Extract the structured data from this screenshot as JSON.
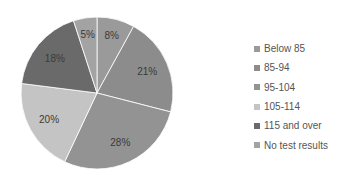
{
  "chart_data": {
    "type": "pie",
    "title": "",
    "categories": [
      "Below 85",
      "85-94",
      "95-104",
      "105-114",
      "115 and over",
      "No test results"
    ],
    "values": [
      8,
      21,
      28,
      20,
      18,
      5
    ],
    "labels": [
      "8%",
      "21%",
      "28%",
      "20%",
      "18%",
      "5%"
    ],
    "colors": [
      "#9a9a9a",
      "#8c8c8c",
      "#939393",
      "#c4c4c4",
      "#6a6a6a",
      "#a3a3a3"
    ],
    "start_angle": "12 o'clock",
    "direction": "clockwise",
    "legend_position": "right"
  },
  "legend": {
    "items": [
      {
        "label": "Below 85",
        "color": "#9a9a9a"
      },
      {
        "label": "85-94",
        "color": "#8c8c8c"
      },
      {
        "label": "95-104",
        "color": "#939393"
      },
      {
        "label": "105-114",
        "color": "#c4c4c4"
      },
      {
        "label": "115 and over",
        "color": "#6a6a6a"
      },
      {
        "label": "No test results",
        "color": "#a3a3a3"
      }
    ]
  }
}
